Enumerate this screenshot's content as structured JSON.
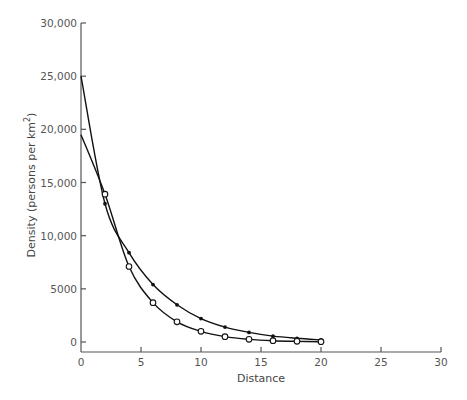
{
  "chart_data": {
    "type": "line",
    "title": "",
    "xlabel": "Distance",
    "ylabel": "Density (persons per km²)",
    "ylabel_main": "Density (persons per km",
    "ylabel_sup": "2",
    "ylabel_close": ")",
    "xlim": [
      0,
      30
    ],
    "ylim": [
      0,
      30000
    ],
    "x_ticks": [
      0,
      5,
      10,
      15,
      20,
      25,
      30
    ],
    "x_tick_labels": [
      "0",
      "5",
      "10",
      "15",
      "20",
      "25",
      "30"
    ],
    "y_ticks": [
      0,
      5000,
      10000,
      15000,
      20000,
      25000,
      30000
    ],
    "y_tick_labels": [
      "0",
      "5000",
      "10,000",
      "15,000",
      "20,000",
      "25,000",
      "30,000"
    ],
    "grid": false,
    "legend": null,
    "series": [
      {
        "name": "filled-markers",
        "marker": "filled-dot",
        "x": [
          0,
          2,
          4,
          6,
          8,
          10,
          12,
          14,
          16,
          18,
          20
        ],
        "y": [
          25000,
          13000,
          8400,
          5400,
          3500,
          2200,
          1400,
          900,
          550,
          350,
          200
        ]
      },
      {
        "name": "open-markers",
        "marker": "open-circle",
        "x": [
          0,
          2,
          4,
          6,
          8,
          10,
          12,
          14,
          16,
          18,
          20
        ],
        "y": [
          19500,
          13900,
          7100,
          3700,
          1900,
          1000,
          500,
          250,
          120,
          60,
          30
        ]
      }
    ]
  },
  "colors": {
    "line": "#111111",
    "axis": "#555555",
    "text": "#555555",
    "background": "#ffffff"
  }
}
